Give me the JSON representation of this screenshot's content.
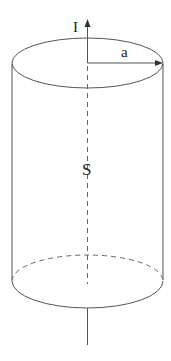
{
  "diagram": {
    "labels": {
      "current": "I",
      "radius": "a",
      "surface": "S"
    },
    "colors": {
      "line": "#555555",
      "text": "#222222",
      "background": "#ffffff"
    }
  }
}
